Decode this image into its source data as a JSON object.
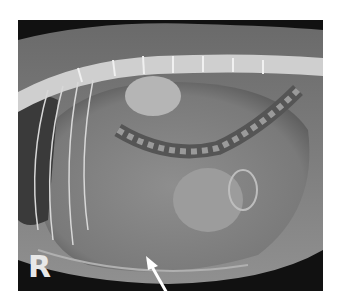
{
  "image": {
    "description": "Lateral abdominal radiograph with arrow indicating ventral abdomen",
    "orientation_marker": "R",
    "annotation": "arrow",
    "colors": {
      "background": "#ffffff",
      "film_dark": "#111111",
      "tissue": "#8a8a8a",
      "bone": "#e0e0e0"
    }
  }
}
